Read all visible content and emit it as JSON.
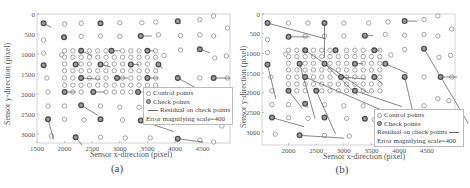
{
  "chart_data": [
    {
      "panel": "a",
      "type": "scatter",
      "title": "",
      "caption": "(a)",
      "xlabel": "Sensor x-direction (pixel)",
      "ylabel": "Sensor y-direction (pixel)",
      "xlim": [
        1500,
        5000
      ],
      "ylim": [
        3200,
        0
      ],
      "xticks": [
        1500,
        2000,
        2500,
        3000,
        3500,
        4000,
        4500
      ],
      "yticks": [
        0,
        500,
        1000,
        1500,
        2000,
        2500,
        3000
      ],
      "grid": false,
      "legend": {
        "position": "lower right",
        "entries": [
          "Control points",
          "Check points",
          "Residual on check points",
          "Error magnifying scale=400"
        ]
      },
      "control_points": [
        [
          4700,
          50
        ],
        [
          2000,
          250
        ],
        [
          2300,
          230
        ],
        [
          3000,
          220
        ],
        [
          3400,
          220
        ],
        [
          3650,
          200
        ],
        [
          4450,
          140
        ],
        [
          4950,
          350
        ],
        [
          1620,
          650
        ],
        [
          2300,
          560
        ],
        [
          2650,
          550
        ],
        [
          3000,
          560
        ],
        [
          3700,
          520
        ],
        [
          4100,
          540
        ],
        [
          4450,
          520
        ],
        [
          4700,
          550
        ],
        [
          1620,
          980
        ],
        [
          1950,
          1020
        ],
        [
          4930,
          1050
        ],
        [
          4720,
          1100
        ],
        [
          3800,
          1040
        ],
        [
          4100,
          900
        ],
        [
          1680,
          1600
        ],
        [
          4450,
          1600
        ],
        [
          4950,
          1600
        ],
        [
          1700,
          1950
        ],
        [
          1700,
          2300
        ],
        [
          2000,
          2300
        ],
        [
          2650,
          2300
        ],
        [
          3000,
          2330
        ],
        [
          3350,
          2330
        ],
        [
          2000,
          2630
        ],
        [
          2350,
          2650
        ],
        [
          3050,
          2650
        ],
        [
          3550,
          2680
        ],
        [
          4850,
          2800
        ],
        [
          1760,
          3050
        ],
        [
          2650,
          3080
        ],
        [
          3100,
          3100
        ],
        [
          3550,
          3100
        ],
        [
          4450,
          3150
        ],
        [
          4700,
          3200
        ]
      ],
      "grid_control_points": {
        "x": [
          2000,
          2150,
          2300,
          2450,
          2600,
          2750,
          2900,
          3050,
          3200,
          3350,
          3500,
          3650
        ],
        "y": [
          920,
          1080,
          1250,
          1420,
          1600,
          1780,
          1950
        ]
      },
      "check_points": [
        {
          "p": [
            1620,
            230
          ],
          "r": [
            140,
            110
          ]
        },
        {
          "p": [
            2650,
            230
          ],
          "r": [
            0,
            0
          ]
        },
        {
          "p": [
            4050,
            180
          ],
          "r": [
            60,
            60
          ]
        },
        {
          "p": [
            1990,
            580
          ],
          "r": [
            0,
            0
          ]
        },
        {
          "p": [
            3380,
            550
          ],
          "r": [
            200,
            0
          ]
        },
        {
          "p": [
            2300,
            920
          ],
          "r": [
            200,
            120
          ]
        },
        {
          "p": [
            2850,
            920
          ],
          "r": [
            150,
            0
          ]
        },
        {
          "p": [
            3500,
            920
          ],
          "r": [
            120,
            0
          ]
        },
        {
          "p": [
            4450,
            880
          ],
          "r": [
            180,
            90
          ]
        },
        {
          "p": [
            1620,
            1280
          ],
          "r": [
            0,
            0
          ]
        },
        {
          "p": [
            2200,
            1260
          ],
          "r": [
            60,
            0
          ]
        },
        {
          "p": [
            2650,
            1260
          ],
          "r": [
            180,
            60
          ]
        },
        {
          "p": [
            3200,
            1260
          ],
          "r": [
            150,
            0
          ]
        },
        {
          "p": [
            3700,
            1260
          ],
          "r": [
            80,
            100
          ]
        },
        {
          "p": [
            2300,
            1600
          ],
          "r": [
            350,
            30
          ]
        },
        {
          "p": [
            2950,
            1600
          ],
          "r": [
            200,
            0
          ]
        },
        {
          "p": [
            3500,
            1600
          ],
          "r": [
            200,
            0
          ]
        },
        {
          "p": [
            4050,
            1600
          ],
          "r": [
            400,
            300
          ]
        },
        {
          "p": [
            4700,
            1600
          ],
          "r": [
            300,
            0
          ]
        },
        {
          "p": [
            2000,
            1950
          ],
          "r": [
            200,
            0
          ]
        },
        {
          "p": [
            2520,
            1950
          ],
          "r": [
            200,
            0
          ]
        },
        {
          "p": [
            3330,
            1950
          ],
          "r": [
            150,
            0
          ]
        },
        {
          "p": [
            3700,
            1950
          ],
          "r": [
            100,
            60
          ]
        },
        {
          "p": [
            2300,
            2280
          ],
          "r": [
            300,
            250
          ]
        },
        {
          "p": [
            1700,
            2630
          ],
          "r": [
            100,
            500
          ]
        },
        {
          "p": [
            2650,
            2630
          ],
          "r": [
            0,
            0
          ]
        },
        {
          "p": [
            3380,
            2660
          ],
          "r": [
            600,
            280
          ]
        },
        {
          "p": [
            2200,
            3080
          ],
          "r": [
            120,
            200
          ]
        },
        {
          "p": [
            4050,
            3120
          ],
          "r": [
            450,
            80
          ]
        }
      ]
    },
    {
      "panel": "b",
      "type": "scatter",
      "title": "",
      "caption": "(b)",
      "xlabel": "Sensor x-direction (pixel)",
      "ylabel": "Sensor y-direction (pixel)",
      "xlim": [
        1500,
        5000
      ],
      "ylim": [
        3300,
        0
      ],
      "xticks": [
        2000,
        2500,
        3000,
        3500,
        4000,
        4500
      ],
      "yticks": [
        0,
        500,
        1000,
        1500,
        2000,
        2500,
        3000
      ],
      "grid": false,
      "legend": {
        "position": "lower right",
        "entries": [
          "Control points",
          "Check points",
          "Residual on check points",
          "Error magnifying scale=400"
        ]
      },
      "control_points": [
        [
          4700,
          50
        ],
        [
          2000,
          230
        ],
        [
          2350,
          230
        ],
        [
          3000,
          230
        ],
        [
          3450,
          230
        ],
        [
          3800,
          200
        ],
        [
          4450,
          140
        ],
        [
          4950,
          380
        ],
        [
          1620,
          650
        ],
        [
          2300,
          560
        ],
        [
          2650,
          560
        ],
        [
          3000,
          560
        ],
        [
          3750,
          520
        ],
        [
          4100,
          540
        ],
        [
          4450,
          520
        ],
        [
          4700,
          560
        ],
        [
          1620,
          980
        ],
        [
          1950,
          1020
        ],
        [
          4930,
          1050
        ],
        [
          4720,
          1100
        ],
        [
          3850,
          1040
        ],
        [
          4100,
          900
        ],
        [
          1680,
          1600
        ],
        [
          4450,
          1600
        ],
        [
          4950,
          1600
        ],
        [
          1700,
          1950
        ],
        [
          1700,
          2300
        ],
        [
          2000,
          2300
        ],
        [
          2650,
          2300
        ],
        [
          3000,
          2330
        ],
        [
          3350,
          2330
        ],
        [
          4450,
          2330
        ],
        [
          4700,
          2150
        ],
        [
          4900,
          2200
        ],
        [
          2000,
          2630
        ],
        [
          2350,
          2650
        ],
        [
          3050,
          2650
        ],
        [
          3550,
          2680
        ],
        [
          1760,
          3050
        ],
        [
          2650,
          3080
        ],
        [
          3100,
          3100
        ]
      ],
      "grid_control_points": {
        "x": [
          2000,
          2150,
          2300,
          2450,
          2600,
          2750,
          2900,
          3050,
          3200,
          3350,
          3500,
          3650
        ],
        "y": [
          920,
          1080,
          1250,
          1420,
          1600,
          1780,
          1950
        ]
      },
      "check_points": [
        {
          "p": [
            1620,
            230
          ],
          "r": [
            1050,
            400
          ]
        },
        {
          "p": [
            2650,
            230
          ],
          "r": [
            0,
            880
          ]
        },
        {
          "p": [
            4100,
            180
          ],
          "r": [
            230,
            0
          ]
        },
        {
          "p": [
            2000,
            580
          ],
          "r": [
            380,
            0
          ]
        },
        {
          "p": [
            3380,
            550
          ],
          "r": [
            150,
            0
          ]
        },
        {
          "p": [
            2300,
            920
          ],
          "r": [
            1150,
            1100
          ]
        },
        {
          "p": [
            2850,
            920
          ],
          "r": [
            0,
            0
          ]
        },
        {
          "p": [
            3550,
            920
          ],
          "r": [
            100,
            0
          ]
        },
        {
          "p": [
            4450,
            880
          ],
          "r": [
            800,
            1900
          ]
        },
        {
          "p": [
            1620,
            1280
          ],
          "r": [
            150,
            880
          ]
        },
        {
          "p": [
            2200,
            1260
          ],
          "r": [
            280,
            1400
          ]
        },
        {
          "p": [
            2650,
            1260
          ],
          "r": [
            600,
            800
          ]
        },
        {
          "p": [
            3200,
            1260
          ],
          "r": [
            150,
            0
          ]
        },
        {
          "p": [
            3750,
            1260
          ],
          "r": [
            400,
            250
          ]
        },
        {
          "p": [
            2300,
            1600
          ],
          "r": [
            1400,
            850
          ]
        },
        {
          "p": [
            2950,
            1600
          ],
          "r": [
            450,
            50
          ]
        },
        {
          "p": [
            3550,
            1600
          ],
          "r": [
            150,
            180
          ]
        },
        {
          "p": [
            4100,
            1600
          ],
          "r": [
            200,
            1200
          ]
        },
        {
          "p": [
            4750,
            1600
          ],
          "r": [
            300,
            0
          ]
        },
        {
          "p": [
            2000,
            1950
          ],
          "r": [
            250,
            450
          ]
        },
        {
          "p": [
            2500,
            1950
          ],
          "r": [
            350,
            1100
          ]
        },
        {
          "p": [
            3200,
            1950
          ],
          "r": [
            850,
            400
          ]
        },
        {
          "p": [
            2300,
            2280
          ],
          "r": [
            50,
            100
          ]
        },
        {
          "p": [
            1700,
            2630
          ],
          "r": [
            580,
            230
          ]
        },
        {
          "p": [
            2650,
            2630
          ],
          "r": [
            0,
            0
          ]
        },
        {
          "p": [
            3380,
            2660
          ],
          "r": [
            0,
            0
          ]
        },
        {
          "p": [
            2200,
            3080
          ],
          "r": [
            800,
            70
          ]
        }
      ]
    }
  ],
  "panels": {
    "a": {
      "caption": "(a)",
      "xlabel": "Sensor x-direction (pixel)",
      "ylabel": "Sensor y-direction (pixel)",
      "legend": {
        "control": "Control points",
        "check": "Check points",
        "residual": "Residual on check points",
        "scale": "Error magnifying scale=400"
      }
    },
    "b": {
      "caption": "(b)",
      "xlabel": "Sensor x-direction (pixel)",
      "ylabel": "Sensor y-direction (pixel)",
      "legend": {
        "control": "Control points",
        "check": "Check points",
        "residual": "Residual on check points",
        "scale": "Error magnifying scale=400"
      }
    }
  },
  "colors": {
    "control_stroke": "#9a9a9a",
    "check_stroke": "#4a4a4a",
    "check_fill": "#9a9a9a",
    "residual": "#666666",
    "axis": "#c8c8c8"
  }
}
